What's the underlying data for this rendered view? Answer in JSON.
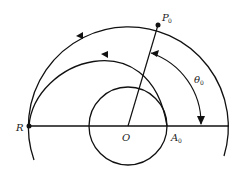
{
  "diagram": {
    "labels": {
      "P": "P",
      "P_sub": "0",
      "theta": "θ",
      "theta_sub": "0",
      "R": "R",
      "O": "O",
      "A": "A",
      "A_sub": "0"
    },
    "colors": {
      "stroke": "#111111",
      "background": "#ffffff"
    }
  }
}
